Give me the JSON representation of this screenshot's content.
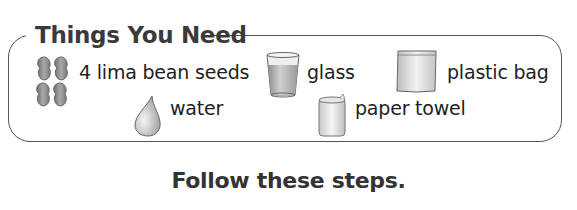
{
  "panel": {
    "title": "Things You Need",
    "items": [
      {
        "label": "4 lima bean seeds",
        "icon": "lima-beans-icon"
      },
      {
        "label": "glass",
        "icon": "glass-icon"
      },
      {
        "label": "plastic bag",
        "icon": "plastic-bag-icon"
      },
      {
        "label": "water",
        "icon": "water-drop-icon"
      },
      {
        "label": "paper towel",
        "icon": "paper-towel-icon"
      }
    ]
  },
  "footer": {
    "text": "Follow these steps."
  },
  "colors": {
    "border": "#555555",
    "text": "#222222",
    "icon_fill": "#9a9a9a"
  }
}
